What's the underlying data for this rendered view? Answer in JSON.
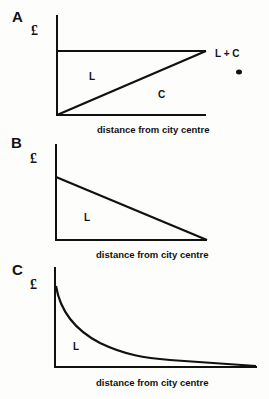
{
  "panels": [
    {
      "letter": "A",
      "y_unit": "£",
      "xlabel": "distance from city centre",
      "regions": [
        "L",
        "C"
      ],
      "line_label": "L + C"
    },
    {
      "letter": "B",
      "y_unit": "£",
      "xlabel": "distance from city centre",
      "regions": [
        "L"
      ]
    },
    {
      "letter": "C",
      "y_unit": "£",
      "xlabel": "distance from city centre",
      "regions": [
        "L"
      ]
    }
  ]
}
